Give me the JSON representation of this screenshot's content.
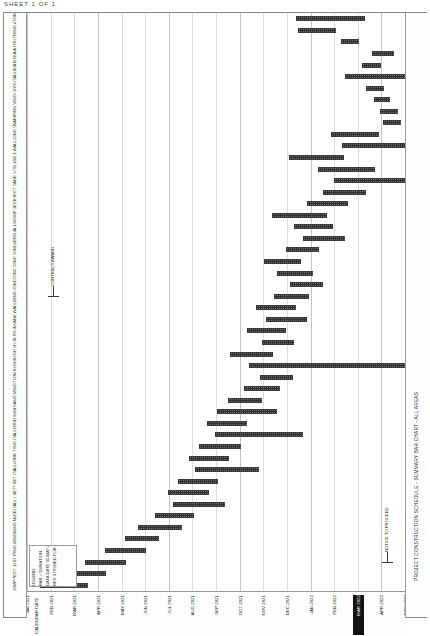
{
  "document": {
    "header_text": "SHEET 1 OF 1"
  },
  "chart_data": {
    "type": "bar",
    "orientation": "horizontal-gantt",
    "title": "PROJECT CONSTRUCTION SCHEDULE - SUMMARY BAR CHART - ALL AREAS",
    "xlabel": "CALENDAR DATE",
    "ylabel": "",
    "grid": true,
    "legend_position": "bottom-left",
    "categories": [
      "MOBILIZATION",
      "SITE CLEARING",
      "SURVEY & LAYOUT",
      "EXCAVATION AREA A",
      "EXCAVATION AREA B",
      "SHORING INSTALL",
      "DEWATERING SYS",
      "PILE DRIVING",
      "PILE CAP FORMS",
      "PILE CAP REBAR",
      "PILE CAP CONC",
      "FOUNDATION WALL",
      "BACKFILL PHASE 1",
      "UNDERSLAB UTIL",
      "SLAB ON GRADE",
      "STRUCT STEEL ERECT",
      "METAL DECK",
      "STEEL FIREPROOF",
      "ELEV CORE WALLS",
      "STAIR TOWERS",
      "LEVEL 2 CONC",
      "LEVEL 3 CONC",
      "LEVEL 4 CONC",
      "ROOF DECK CONC",
      "EXTERIOR FRAMING",
      "CURTAIN WALL",
      "ROOFING MEMBRANE",
      "BLDG DRY-IN",
      "HVAC ROUGH-IN",
      "PLUMBING ROUGH",
      "ELECTRICAL ROUGH",
      "FIRE PROTECTION",
      "INTERIOR FRAMING",
      "DRYWALL HANG",
      "DRYWALL FINISH",
      "CEILING GRID",
      "FLOORING INSTALL",
      "PAINTING",
      "MILLWORK",
      "ELEVATOR INSTALL",
      "MECH EQUIP SET",
      "ELEC GEAR SET",
      "CONTROLS INSTALL",
      "TEST & BALANCE",
      "COMMISSIONING",
      "SITE PAVING",
      "LANDSCAPING",
      "PUNCH LIST",
      "FINAL INSPECT",
      "SUBSTANTIAL COMP"
    ],
    "x_tick_labels": [
      "JAN 2021",
      "FEB 2021",
      "MAR 2021",
      "APR 2021",
      "MAY 2021",
      "JUN 2021",
      "JUL 2021",
      "AUG 2021",
      "SEP 2021",
      "OCT 2021",
      "NOV 2021",
      "DEC 2021",
      "JAN 2022",
      "FEB 2022",
      "MAR 2022",
      "APR 2022",
      "MAY 2022"
    ],
    "x_tick_highlight_index": 14,
    "xlim": [
      0,
      16
    ],
    "bars": [
      {
        "row": 0,
        "start": 11.4,
        "end": 14.3
      },
      {
        "row": 1,
        "start": 11.45,
        "end": 13.1
      },
      {
        "row": 2,
        "start": 13.3,
        "end": 14.05
      },
      {
        "row": 3,
        "start": 14.6,
        "end": 15.55
      },
      {
        "row": 4,
        "start": 14.2,
        "end": 15.0
      },
      {
        "row": 5,
        "start": 13.45,
        "end": 16.4
      },
      {
        "row": 6,
        "start": 14.35,
        "end": 15.1
      },
      {
        "row": 7,
        "start": 14.7,
        "end": 15.35
      },
      {
        "row": 8,
        "start": 14.95,
        "end": 15.7
      },
      {
        "row": 9,
        "start": 15.05,
        "end": 15.85
      },
      {
        "row": 10,
        "start": 12.85,
        "end": 14.9
      },
      {
        "row": 11,
        "start": 13.35,
        "end": 16.3
      },
      {
        "row": 12,
        "start": 11.1,
        "end": 13.4
      },
      {
        "row": 13,
        "start": 12.3,
        "end": 14.75
      },
      {
        "row": 14,
        "start": 13.0,
        "end": 16.55
      },
      {
        "row": 15,
        "start": 12.55,
        "end": 14.35
      },
      {
        "row": 16,
        "start": 11.85,
        "end": 13.6
      },
      {
        "row": 17,
        "start": 10.35,
        "end": 12.7
      },
      {
        "row": 18,
        "start": 11.3,
        "end": 12.95
      },
      {
        "row": 19,
        "start": 11.7,
        "end": 13.45
      },
      {
        "row": 20,
        "start": 10.95,
        "end": 12.35
      },
      {
        "row": 21,
        "start": 10.05,
        "end": 11.6
      },
      {
        "row": 22,
        "start": 10.6,
        "end": 12.1
      },
      {
        "row": 23,
        "start": 11.15,
        "end": 12.55
      },
      {
        "row": 24,
        "start": 10.45,
        "end": 11.95
      },
      {
        "row": 25,
        "start": 9.7,
        "end": 11.4
      },
      {
        "row": 26,
        "start": 10.1,
        "end": 11.85
      },
      {
        "row": 27,
        "start": 9.3,
        "end": 10.95
      },
      {
        "row": 28,
        "start": 9.95,
        "end": 11.3
      },
      {
        "row": 29,
        "start": 8.6,
        "end": 10.4
      },
      {
        "row": 30,
        "start": 9.4,
        "end": 16.35
      },
      {
        "row": 31,
        "start": 9.85,
        "end": 11.25
      },
      {
        "row": 32,
        "start": 9.2,
        "end": 10.7
      },
      {
        "row": 33,
        "start": 8.5,
        "end": 9.95
      },
      {
        "row": 34,
        "start": 8.05,
        "end": 10.6
      },
      {
        "row": 35,
        "start": 7.6,
        "end": 9.3
      },
      {
        "row": 36,
        "start": 7.95,
        "end": 11.7
      },
      {
        "row": 37,
        "start": 7.3,
        "end": 9.05
      },
      {
        "row": 38,
        "start": 6.85,
        "end": 8.55
      },
      {
        "row": 39,
        "start": 7.1,
        "end": 9.8
      },
      {
        "row": 40,
        "start": 6.4,
        "end": 8.1
      },
      {
        "row": 41,
        "start": 5.95,
        "end": 7.7
      },
      {
        "row": 42,
        "start": 6.2,
        "end": 8.4
      },
      {
        "row": 43,
        "start": 5.4,
        "end": 7.05
      },
      {
        "row": 44,
        "start": 4.7,
        "end": 6.55
      },
      {
        "row": 45,
        "start": 4.15,
        "end": 5.6
      },
      {
        "row": 46,
        "start": 3.3,
        "end": 5.05
      },
      {
        "row": 47,
        "start": 2.45,
        "end": 4.2
      },
      {
        "row": 48,
        "start": 1.6,
        "end": 3.35
      },
      {
        "row": 49,
        "start": 0.55,
        "end": 2.6
      }
    ],
    "annotations": [
      {
        "text": "CONTRACT AWARD",
        "x": 1.1,
        "row": 24
      },
      {
        "text": "NOTICE TO PROCEED",
        "x": 15.25,
        "row": 47
      }
    ],
    "legend": [
      "LEGEND:",
      "BAR = DURATION",
      "DATA DATE 01-MAY-21",
      "REV 3  ISSUED FOR CONST"
    ]
  }
}
